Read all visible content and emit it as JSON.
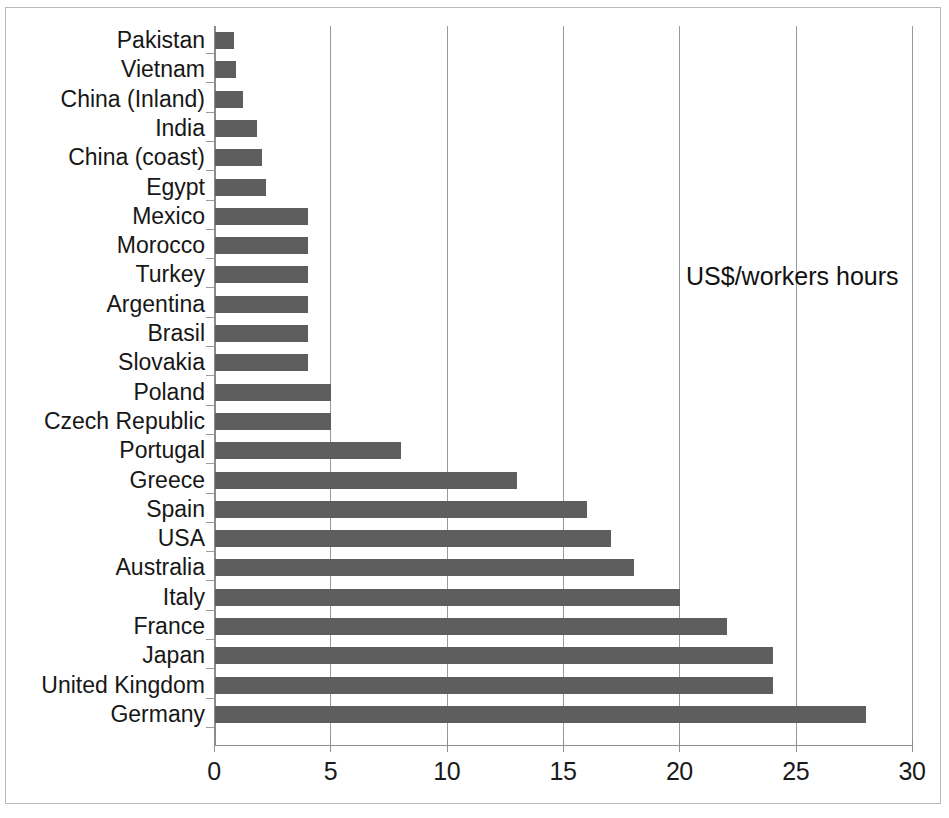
{
  "annotation": {
    "text": "US$/workers hours"
  },
  "chart_data": {
    "type": "bar",
    "orientation": "horizontal",
    "title": "",
    "subtitle": "",
    "xlabel": "",
    "ylabel": "",
    "annotations": [
      "US$/workers hours"
    ],
    "legend": [],
    "legend_position": "none",
    "grid": true,
    "xlim": [
      0,
      30
    ],
    "xticks": [
      0,
      5,
      10,
      15,
      20,
      25,
      30
    ],
    "xtick_labels": [
      "0",
      "5",
      "10",
      "15",
      "20",
      "25",
      "30"
    ],
    "categories": [
      "Pakistan",
      "Vietnam",
      "China (Inland)",
      "India",
      "China (coast)",
      "Egypt",
      "Mexico",
      "Morocco",
      "Turkey",
      "Argentina",
      "Brasil",
      "Slovakia",
      "Poland",
      "Czech Republic",
      "Portugal",
      "Greece",
      "Spain",
      "USA",
      "Australia",
      "Italy",
      "France",
      "Japan",
      "United Kingdom",
      "Germany"
    ],
    "values": [
      0.8,
      0.9,
      1.2,
      1.8,
      2.0,
      2.2,
      4,
      4,
      4,
      4,
      4,
      4,
      5,
      5,
      8,
      13,
      16,
      17,
      18,
      20,
      22,
      24,
      24,
      28
    ],
    "bar_color": "#5e5e5e",
    "axis_color": "#8f8f8f",
    "grid_color": "#9a9a9a"
  }
}
